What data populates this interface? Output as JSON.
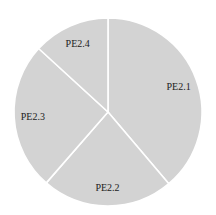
{
  "chart_data": {
    "type": "pie",
    "title": "",
    "categories": [
      "PE2.1",
      "PE2.2",
      "PE2.3",
      "PE2.4"
    ],
    "values": [
      38.8,
      22.6,
      25.4,
      13.2
    ],
    "start_angle_deg": 0,
    "direction": "clockwise",
    "legend": "none",
    "labels_inside": true,
    "colors": {
      "fill": "#d3d3d3",
      "divider": "#ffffff",
      "label": "#222222"
    },
    "geometry": {
      "cx": 108,
      "cy": 112,
      "r": 94
    }
  }
}
